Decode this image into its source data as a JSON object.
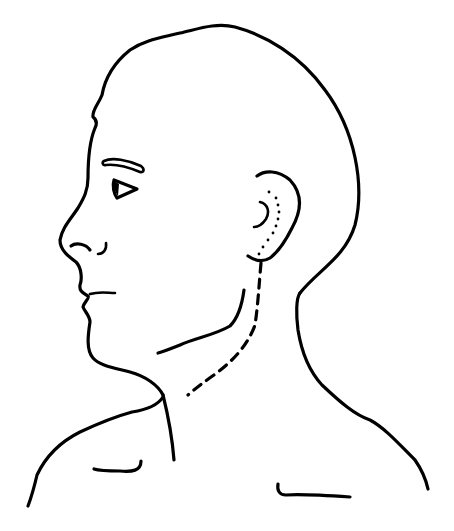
{
  "figure": {
    "title": "",
    "colors": {
      "background": "#ffffff",
      "line": "#000000"
    },
    "elements": [
      {
        "name": "head-outline",
        "style": "solid"
      },
      {
        "name": "eyebrow",
        "style": "outlined"
      },
      {
        "name": "eye",
        "style": "solid triangle"
      },
      {
        "name": "nostril",
        "style": "solid"
      },
      {
        "name": "ear",
        "style": "solid"
      },
      {
        "name": "ear-dotted-line",
        "style": "dotted"
      },
      {
        "name": "jaw-line",
        "style": "solid"
      },
      {
        "name": "neck-dashed-line",
        "style": "dashed"
      },
      {
        "name": "front-neck-line",
        "style": "solid"
      },
      {
        "name": "back-neck-shoulder-line",
        "style": "solid"
      },
      {
        "name": "front-shoulder-line",
        "style": "solid"
      },
      {
        "name": "left-clavicle-mark",
        "style": "solid"
      },
      {
        "name": "right-clavicle-mark",
        "style": "solid"
      }
    ]
  }
}
